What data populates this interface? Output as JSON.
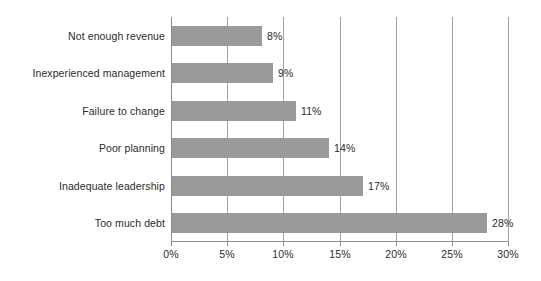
{
  "chart_data": {
    "type": "bar",
    "orientation": "horizontal",
    "title": "",
    "xlabel": "",
    "ylabel": "",
    "categories": [
      "Not enough revenue",
      "Inexperienced management",
      "Failure to change",
      "Poor planning",
      "Inadequate leadership",
      "Too much debt"
    ],
    "values": [
      8,
      9,
      11,
      14,
      17,
      28
    ],
    "data_labels": [
      "8%",
      "9%",
      "11%",
      "14%",
      "17%",
      "28%"
    ],
    "xlim": [
      0,
      30
    ],
    "xticks": [
      0,
      5,
      10,
      15,
      20,
      25,
      30
    ],
    "xtick_labels": [
      "0%",
      "5%",
      "10%",
      "15%",
      "20%",
      "25%",
      "30%"
    ],
    "grid": true,
    "grid_axis": "x",
    "legend": false,
    "bar_color": "#9a9a9a",
    "gridline_color": "#a3a3a3",
    "axis_color": "#8d8d8d",
    "text_color": "#2b2b2b",
    "background_color": "#ffffff"
  }
}
